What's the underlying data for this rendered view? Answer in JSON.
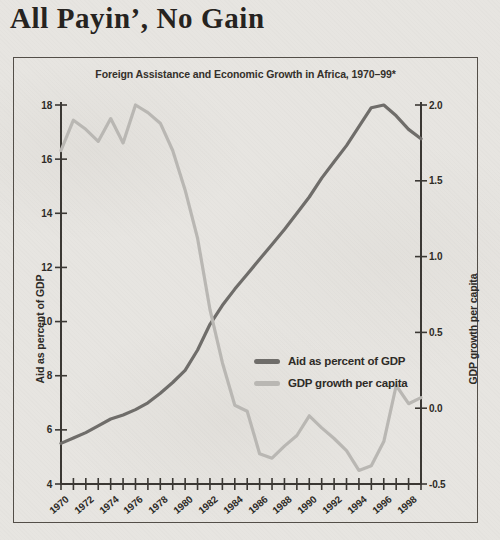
{
  "title": "All Payin’, No Gain",
  "colors": {
    "background": "#e7e5e1",
    "axis": "#3b3834",
    "text": "#2e2b27",
    "aid_line": "#6f6d6a",
    "gdp_line": "#b9b7b3",
    "panel_border": "#534e48"
  },
  "legend": {
    "items": [
      {
        "label": "Aid as percent of GDP",
        "color": "#6f6d6a"
      },
      {
        "label": "GDP growth per capita",
        "color": "#b9b7b3"
      }
    ]
  },
  "chart_data": {
    "type": "line",
    "title": "Foreign Assistance and Economic Growth in Africa, 1970–99*",
    "x": [
      1970,
      1971,
      1972,
      1973,
      1974,
      1975,
      1976,
      1977,
      1978,
      1979,
      1980,
      1981,
      1982,
      1983,
      1984,
      1985,
      1986,
      1987,
      1988,
      1989,
      1990,
      1991,
      1992,
      1993,
      1994,
      1995,
      1996,
      1997,
      1998,
      1999
    ],
    "x_tick_labels": [
      "1970",
      "1972",
      "1974",
      "1976",
      "1978",
      "1980",
      "1982",
      "1984",
      "1986",
      "1988",
      "1990",
      "1992",
      "1994",
      "1996",
      "1998"
    ],
    "left_axis_label": "Aid as percent of GDP",
    "right_axis_label": "GDP growth per capita",
    "left_ticks": [
      "18",
      "16",
      "14",
      "12",
      "10",
      "8",
      "6",
      "4"
    ],
    "right_ticks": [
      "2.0",
      "1.5",
      "1.0",
      "0.5",
      "0.0",
      "-0.5"
    ],
    "left_ylim": [
      4,
      18
    ],
    "right_ylim": [
      -0.5,
      2.0
    ],
    "grid": false,
    "legend_position": "center",
    "series": [
      {
        "id": "aid-line",
        "name": "Aid as percent of GDP",
        "axis": "left",
        "color": "#6f6d6a",
        "values": [
          5.5,
          5.7,
          5.9,
          6.15,
          6.4,
          6.55,
          6.75,
          7.0,
          7.35,
          7.75,
          8.2,
          8.95,
          9.9,
          10.6,
          11.2,
          11.75,
          12.3,
          12.85,
          13.4,
          14.0,
          14.6,
          15.3,
          15.9,
          16.5,
          17.2,
          17.9,
          18.0,
          17.6,
          17.1,
          16.75
        ]
      },
      {
        "id": "gdp-line",
        "name": "GDP growth per capita",
        "axis": "right",
        "color": "#b9b7b3",
        "values": [
          1.7,
          1.9,
          1.84,
          1.76,
          1.91,
          1.75,
          2.0,
          1.95,
          1.88,
          1.7,
          1.44,
          1.12,
          0.65,
          0.3,
          0.02,
          -0.02,
          -0.3,
          -0.33,
          -0.25,
          -0.18,
          -0.05,
          -0.13,
          -0.2,
          -0.28,
          -0.41,
          -0.38,
          -0.22,
          0.15,
          0.03,
          0.07
        ]
      }
    ]
  }
}
